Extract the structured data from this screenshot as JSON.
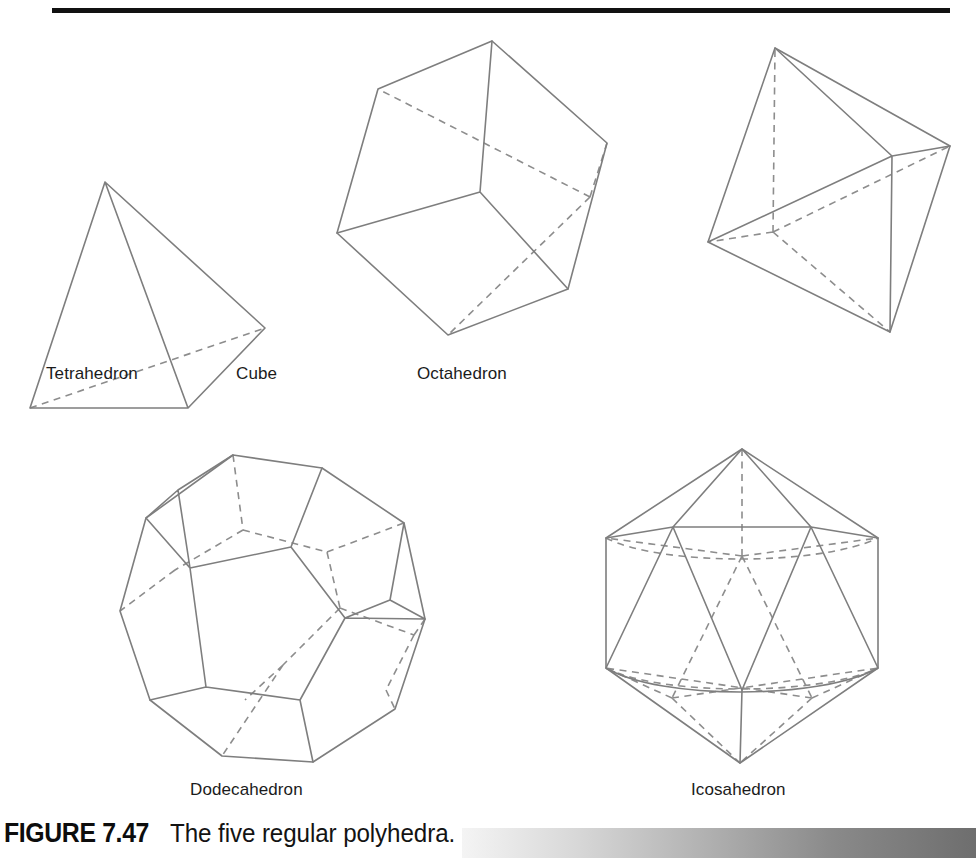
{
  "figure": {
    "caption_number": "FIGURE 7.47",
    "caption_text": "The five regular polyhedra.",
    "background_color": "#ffffff",
    "rule_color": "#111111",
    "line_color": "#7e7e7e",
    "hidden_line_color": "#8d8d8d",
    "gradient_from": "#f4f4f4",
    "gradient_to": "#6e6e6e"
  },
  "solids": [
    {
      "id": "tetrahedron",
      "label": "Tetrahedron",
      "faces": 4,
      "vertices_count": 4,
      "edges_count": 6,
      "face_shape": "triangle"
    },
    {
      "id": "cube",
      "label": "Cube",
      "faces": 6,
      "vertices_count": 8,
      "edges_count": 12,
      "face_shape": "square"
    },
    {
      "id": "octahedron",
      "label": "Octahedron",
      "faces": 8,
      "vertices_count": 6,
      "edges_count": 12,
      "face_shape": "triangle"
    },
    {
      "id": "dodecahedron",
      "label": "Dodecahedron",
      "faces": 12,
      "vertices_count": 20,
      "edges_count": 30,
      "face_shape": "pentagon"
    },
    {
      "id": "icosahedron",
      "label": "Icosahedron",
      "faces": 20,
      "vertices_count": 12,
      "edges_count": 30,
      "face_shape": "triangle"
    }
  ]
}
